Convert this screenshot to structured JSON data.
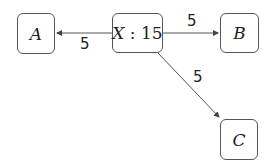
{
  "diagram": {
    "nodes": [
      {
        "id": "A",
        "label": "A"
      },
      {
        "id": "X",
        "label": "X",
        "separator": " : ",
        "value": "15"
      },
      {
        "id": "B",
        "label": "B"
      },
      {
        "id": "C",
        "label": "C"
      }
    ],
    "edges": [
      {
        "from": "X",
        "to": "A",
        "label": "5"
      },
      {
        "from": "X",
        "to": "B",
        "label": "5"
      },
      {
        "from": "X",
        "to": "C",
        "label": "5"
      }
    ],
    "colors": {
      "stroke": "#555555",
      "text": "#222222",
      "background": "#ffffff"
    }
  }
}
